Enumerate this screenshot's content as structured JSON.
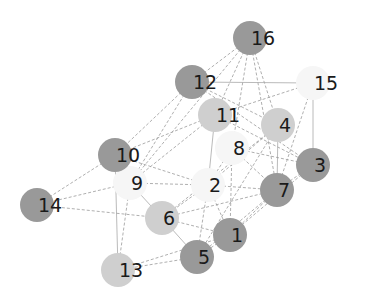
{
  "chart_data": {
    "type": "network",
    "title": "",
    "node_radius": 17,
    "colors": {
      "dark": "#999999",
      "light": "#cfcfcf",
      "white": "#f6f6f6"
    },
    "nodes": [
      {
        "id": "1",
        "label": "1",
        "x": 230,
        "y": 235,
        "shade": "dark"
      },
      {
        "id": "2",
        "label": "2",
        "x": 208,
        "y": 185,
        "shade": "white"
      },
      {
        "id": "3",
        "label": "3",
        "x": 313,
        "y": 165,
        "shade": "dark"
      },
      {
        "id": "4",
        "label": "4",
        "x": 278,
        "y": 125,
        "shade": "light"
      },
      {
        "id": "5",
        "label": "5",
        "x": 197,
        "y": 257,
        "shade": "dark"
      },
      {
        "id": "6",
        "label": "6",
        "x": 162,
        "y": 218,
        "shade": "light"
      },
      {
        "id": "7",
        "label": "7",
        "x": 277,
        "y": 190,
        "shade": "dark"
      },
      {
        "id": "8",
        "label": "8",
        "x": 232,
        "y": 148,
        "shade": "white"
      },
      {
        "id": "9",
        "label": "9",
        "x": 130,
        "y": 183,
        "shade": "white"
      },
      {
        "id": "10",
        "label": "10",
        "x": 115,
        "y": 155,
        "shade": "dark"
      },
      {
        "id": "11",
        "label": "11",
        "x": 215,
        "y": 115,
        "shade": "light"
      },
      {
        "id": "12",
        "label": "12",
        "x": 192,
        "y": 82,
        "shade": "dark"
      },
      {
        "id": "13",
        "label": "13",
        "x": 118,
        "y": 270,
        "shade": "light"
      },
      {
        "id": "14",
        "label": "14",
        "x": 37,
        "y": 205,
        "shade": "dark"
      },
      {
        "id": "15",
        "label": "15",
        "x": 313,
        "y": 83,
        "shade": "white"
      },
      {
        "id": "16",
        "label": "16",
        "x": 250,
        "y": 38,
        "shade": "dark"
      }
    ],
    "edges": [
      {
        "source": "16",
        "target": "12",
        "style": "dashed"
      },
      {
        "source": "16",
        "target": "11",
        "style": "dashed"
      },
      {
        "source": "16",
        "target": "4",
        "style": "dashed"
      },
      {
        "source": "16",
        "target": "8",
        "style": "dashed"
      },
      {
        "source": "16",
        "target": "9",
        "style": "dashed"
      },
      {
        "source": "16",
        "target": "7",
        "style": "dashed"
      },
      {
        "source": "12",
        "target": "10",
        "style": "dashed"
      },
      {
        "source": "12",
        "target": "9",
        "style": "dashed"
      },
      {
        "source": "12",
        "target": "4",
        "style": "dashed"
      },
      {
        "source": "12",
        "target": "3",
        "style": "dashed"
      },
      {
        "source": "15",
        "target": "11",
        "style": "dashed"
      },
      {
        "source": "15",
        "target": "3",
        "style": "solid"
      },
      {
        "source": "15",
        "target": "7",
        "style": "dashed"
      },
      {
        "source": "15",
        "target": "12",
        "style": "solid"
      },
      {
        "source": "11",
        "target": "10",
        "style": "dashed"
      },
      {
        "source": "11",
        "target": "9",
        "style": "dashed"
      },
      {
        "source": "11",
        "target": "2",
        "style": "solid"
      },
      {
        "source": "11",
        "target": "3",
        "style": "dashed"
      },
      {
        "source": "4",
        "target": "7",
        "style": "solid"
      },
      {
        "source": "4",
        "target": "2",
        "style": "dashed"
      },
      {
        "source": "4",
        "target": "5",
        "style": "dashed"
      },
      {
        "source": "4",
        "target": "6",
        "style": "dashed"
      },
      {
        "source": "8",
        "target": "3",
        "style": "dashed"
      },
      {
        "source": "8",
        "target": "2",
        "style": "dashed"
      },
      {
        "source": "8",
        "target": "1",
        "style": "dashed"
      },
      {
        "source": "8",
        "target": "7",
        "style": "dashed"
      },
      {
        "source": "3",
        "target": "7",
        "style": "dashed"
      },
      {
        "source": "3",
        "target": "1",
        "style": "dashed"
      },
      {
        "source": "10",
        "target": "14",
        "style": "dashed"
      },
      {
        "source": "10",
        "target": "2",
        "style": "dashed"
      },
      {
        "source": "10",
        "target": "13",
        "style": "solid"
      },
      {
        "source": "9",
        "target": "14",
        "style": "dashed"
      },
      {
        "source": "9",
        "target": "6",
        "style": "solid"
      },
      {
        "source": "9",
        "target": "13",
        "style": "dashed"
      },
      {
        "source": "9",
        "target": "2",
        "style": "dashed"
      },
      {
        "source": "14",
        "target": "6",
        "style": "dashed"
      },
      {
        "source": "2",
        "target": "6",
        "style": "dashed"
      },
      {
        "source": "2",
        "target": "7",
        "style": "dashed"
      },
      {
        "source": "2",
        "target": "5",
        "style": "dashed"
      },
      {
        "source": "2",
        "target": "1",
        "style": "dashed"
      },
      {
        "source": "7",
        "target": "6",
        "style": "dashed"
      },
      {
        "source": "7",
        "target": "1",
        "style": "dashed"
      },
      {
        "source": "7",
        "target": "5",
        "style": "dashed"
      },
      {
        "source": "6",
        "target": "1",
        "style": "dashed"
      },
      {
        "source": "6",
        "target": "5",
        "style": "solid"
      },
      {
        "source": "1",
        "target": "5",
        "style": "dashed"
      },
      {
        "source": "5",
        "target": "13",
        "style": "dashed"
      },
      {
        "source": "1",
        "target": "13",
        "style": "dashed"
      }
    ]
  }
}
